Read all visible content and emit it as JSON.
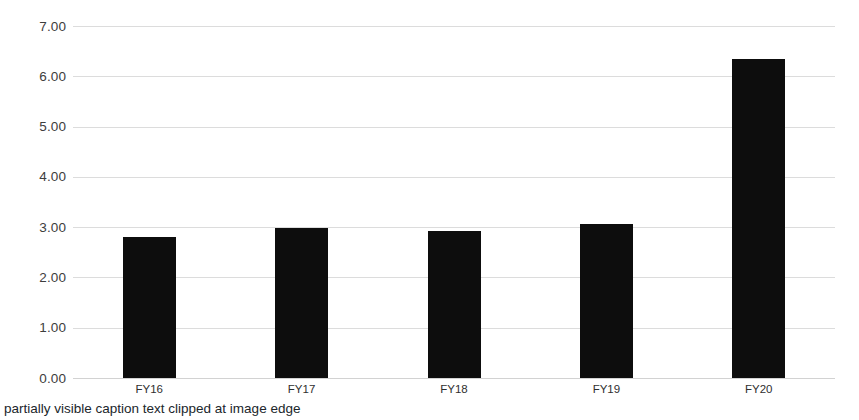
{
  "chart_data": {
    "type": "bar",
    "title": "",
    "subtitle": "",
    "xlabel": "",
    "ylabel": "",
    "categories": [
      "FY16",
      "FY17",
      "FY18",
      "FY19",
      "FY20"
    ],
    "values": [
      2.8,
      2.99,
      2.92,
      3.07,
      6.35
    ],
    "series": [
      {
        "name": "",
        "values": [
          2.8,
          2.99,
          2.92,
          3.07,
          6.35
        ]
      }
    ],
    "ylim": [
      0.0,
      7.0
    ],
    "ytick_values": [
      0.0,
      1.0,
      2.0,
      3.0,
      4.0,
      5.0,
      6.0,
      7.0
    ],
    "ytick_labels": [
      "0.00",
      "1.00",
      "2.00",
      "3.00",
      "4.00",
      "5.00",
      "6.00",
      "7.00"
    ],
    "grid": true,
    "grid_axis": "y",
    "legend": false,
    "legend_position": "none",
    "annotations": [],
    "bar_color": "#0d0d0d",
    "gridline_color": "#dcdcdc",
    "background_color": "#ffffff",
    "axis_text_color": "#3d3d3d"
  },
  "caption": {
    "text": "partially visible caption text clipped at image edge"
  }
}
